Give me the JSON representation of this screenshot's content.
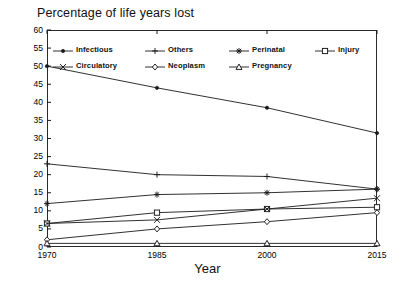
{
  "chart_data": {
    "type": "line",
    "title": "Percentage of life years lost",
    "xlabel": "Year",
    "ylabel": "",
    "x": [
      1970,
      1985,
      2000,
      2015
    ],
    "xtick_labels": [
      "1970",
      "1985",
      "2000",
      "2015"
    ],
    "ytick_labels": [
      "0",
      "5",
      "10",
      "15",
      "20",
      "25",
      "30",
      "35",
      "40",
      "45",
      "50",
      "55",
      "60"
    ],
    "yticks": [
      0,
      5,
      10,
      15,
      20,
      25,
      30,
      35,
      40,
      45,
      50,
      55,
      60
    ],
    "ylim": [
      0,
      60
    ],
    "xlim": [
      1970,
      2015
    ],
    "grid": false,
    "legend_position": "top-inside",
    "series": [
      {
        "name": "Infectious",
        "marker": "filled-circle",
        "values": [
          50.0,
          44.0,
          38.5,
          31.5
        ]
      },
      {
        "name": "Others",
        "marker": "plus",
        "values": [
          23.0,
          20.0,
          19.5,
          16.0
        ]
      },
      {
        "name": "Perinatal",
        "marker": "asterisk",
        "values": [
          12.0,
          14.5,
          15.0,
          16.0
        ]
      },
      {
        "name": "Injury",
        "marker": "open-square",
        "values": [
          6.5,
          9.5,
          10.5,
          11.0
        ]
      },
      {
        "name": "Circulatory",
        "marker": "cross",
        "values": [
          6.5,
          7.5,
          10.5,
          13.5
        ]
      },
      {
        "name": "Neoplasm",
        "marker": "open-diamond",
        "values": [
          2.0,
          5.0,
          7.0,
          9.5
        ]
      },
      {
        "name": "Pregnancy",
        "marker": "open-triangle",
        "values": [
          1.0,
          1.0,
          1.0,
          1.0
        ]
      }
    ]
  },
  "colors": {
    "line": "#1a1a1a",
    "frame": "#2a2a2a",
    "background": "#ffffff",
    "text": "#111111"
  }
}
